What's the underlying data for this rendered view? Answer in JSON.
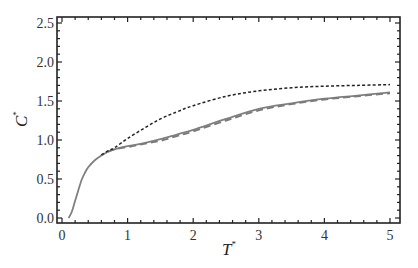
{
  "chart_data": {
    "type": "line",
    "title": "",
    "xlabel": "T*",
    "ylabel": "C*",
    "xlabel_main": "T",
    "ylabel_main": "C",
    "label_sup": "*",
    "xlim": [
      0,
      5
    ],
    "ylim": [
      0,
      2.5
    ],
    "xticks": [
      0,
      1,
      2,
      3,
      4,
      5
    ],
    "xtick_labels": [
      "0",
      "1",
      "2",
      "3",
      "4",
      "5"
    ],
    "yticks": [
      0,
      0.5,
      1.0,
      1.5,
      2.0,
      2.5
    ],
    "ytick_labels": [
      "0.0",
      "0.5",
      "1.0",
      "1.5",
      "2.0",
      "2.5"
    ],
    "grid": false,
    "legend": "none",
    "series": [
      {
        "name": "dotted",
        "style": "short-dash",
        "color": "#222222",
        "x": [
          0.6,
          0.7,
          0.8,
          1.0,
          1.25,
          1.5,
          1.75,
          2.0,
          2.5,
          3.0,
          3.5,
          4.0,
          4.5,
          5.0
        ],
        "y": [
          0.81,
          0.86,
          0.9,
          1.02,
          1.15,
          1.27,
          1.36,
          1.44,
          1.56,
          1.63,
          1.67,
          1.69,
          1.7,
          1.71
        ]
      },
      {
        "name": "solid",
        "style": "solid",
        "color": "#808080",
        "x": [
          0.1,
          0.15,
          0.2,
          0.25,
          0.3,
          0.35,
          0.4,
          0.5,
          0.6,
          0.7,
          0.8,
          1.0,
          1.25,
          1.5,
          1.75,
          2.0,
          2.5,
          3.0,
          3.5,
          4.0,
          4.5,
          5.0
        ],
        "y": [
          0.0,
          0.08,
          0.22,
          0.36,
          0.49,
          0.58,
          0.65,
          0.74,
          0.8,
          0.85,
          0.88,
          0.92,
          0.96,
          1.01,
          1.07,
          1.13,
          1.27,
          1.4,
          1.47,
          1.53,
          1.57,
          1.61
        ]
      },
      {
        "name": "dashed",
        "style": "long-dash",
        "color": "#7a7a7a",
        "x": [
          0.7,
          0.8,
          1.0,
          1.25,
          1.5,
          1.75,
          2.0,
          2.5,
          3.0,
          3.5,
          4.0,
          4.5,
          5.0
        ],
        "y": [
          0.85,
          0.88,
          0.91,
          0.95,
          0.99,
          1.05,
          1.11,
          1.25,
          1.38,
          1.46,
          1.52,
          1.56,
          1.6
        ]
      }
    ]
  }
}
